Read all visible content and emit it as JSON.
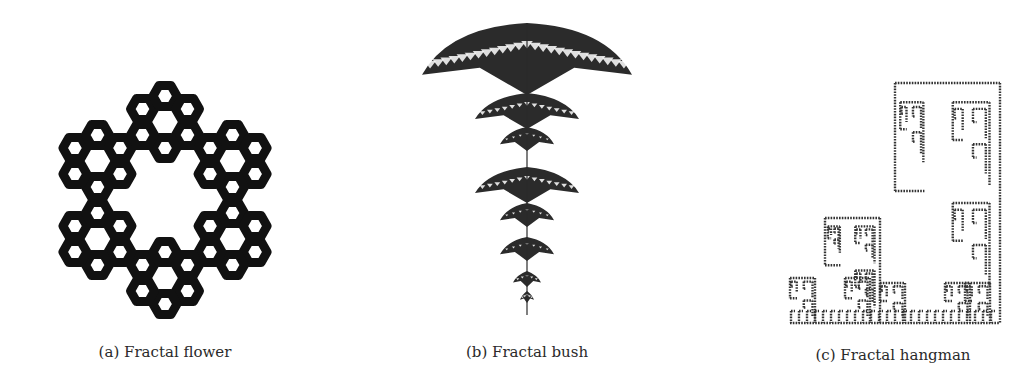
{
  "figure": {
    "panels": [
      {
        "id": "a",
        "caption": "(a) Fractal flower",
        "subject": "hexaflake-like fractal flower: ring of six clusters, each a ring of small hexagonal loops",
        "color": "#111111"
      },
      {
        "id": "b",
        "caption": "(b) Fractal bush",
        "subject": "self-similar hanging bush of stacked fan-shaped canopies tapering to a stem",
        "color": "#2b2b2b"
      },
      {
        "id": "c",
        "caption": "(c) Fractal hangman",
        "subject": "dotted staircase fractal of recursive hook shapes on a baseline",
        "color": "#333333"
      }
    ]
  }
}
